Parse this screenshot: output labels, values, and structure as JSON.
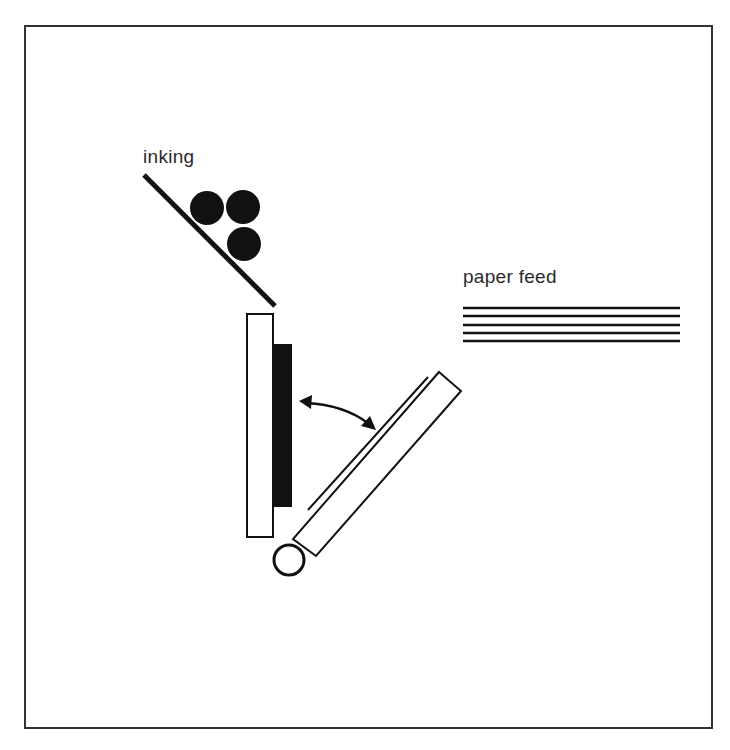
{
  "diagram": {
    "type": "platen press mechanism",
    "labels": {
      "inking": "inking",
      "paper_feed": "paper feed"
    },
    "components": [
      {
        "name": "inking-rollers",
        "count": 3
      },
      {
        "name": "ink-slab"
      },
      {
        "name": "bed-plate"
      },
      {
        "name": "type-forme"
      },
      {
        "name": "platen"
      },
      {
        "name": "paper-sheet"
      },
      {
        "name": "pivot"
      },
      {
        "name": "swing-arrow"
      },
      {
        "name": "paper-stack",
        "sheets": 5
      }
    ],
    "colors": {
      "ink": "#111111",
      "line": "#1a1a1a",
      "frame": "#333333",
      "background": "#ffffff"
    }
  }
}
